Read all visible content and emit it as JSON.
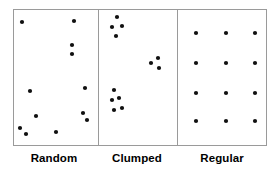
{
  "figure": {
    "frame": {
      "x": 13,
      "y": 9,
      "width": 253,
      "height": 136,
      "stroke": "#9a9a9a"
    },
    "dividers": [
      98,
      177
    ],
    "dot_color": "#101010",
    "dot_radius": 2.1,
    "panels": [
      {
        "id": "random",
        "label": "Random",
        "label_x": 54,
        "label_y": 162,
        "pattern": "random",
        "point_count": 12,
        "points": [
          [
            22,
            22
          ],
          [
            74,
            21
          ],
          [
            72,
            45
          ],
          [
            72,
            54
          ],
          [
            30,
            91
          ],
          [
            85,
            88
          ],
          [
            36,
            116
          ],
          [
            83,
            113
          ],
          [
            87,
            120
          ],
          [
            20,
            128
          ],
          [
            26,
            134
          ],
          [
            56,
            132
          ]
        ]
      },
      {
        "id": "clumped",
        "label": "Clumped",
        "label_x": 137,
        "label_y": 162,
        "pattern": "clumped",
        "point_count": 12,
        "points": [
          [
            117,
            17
          ],
          [
            112,
            27
          ],
          [
            122,
            26
          ],
          [
            116,
            36
          ],
          [
            158,
            58
          ],
          [
            151,
            63
          ],
          [
            159,
            68
          ],
          [
            114,
            90
          ],
          [
            119,
            98
          ],
          [
            112,
            100
          ],
          [
            122,
            108
          ],
          [
            114,
            110
          ]
        ]
      },
      {
        "id": "regular",
        "label": "Regular",
        "label_x": 222,
        "label_y": 162,
        "pattern": "regular",
        "point_count": 12,
        "points": [
          [
            196,
            33
          ],
          [
            226,
            33
          ],
          [
            255,
            33
          ],
          [
            196,
            63
          ],
          [
            226,
            63
          ],
          [
            255,
            63
          ],
          [
            196,
            93
          ],
          [
            226,
            93
          ],
          [
            255,
            93
          ],
          [
            196,
            121
          ],
          [
            226,
            121
          ],
          [
            255,
            121
          ]
        ]
      }
    ]
  },
  "chart_data": {
    "type": "scatter",
    "xlabel": "",
    "ylabel": "",
    "grid": false,
    "legend": "none",
    "series": [
      {
        "name": "Random",
        "x": [
          22,
          74,
          72,
          72,
          30,
          85,
          36,
          83,
          87,
          20,
          26,
          56
        ],
        "y": [
          22,
          21,
          45,
          54,
          91,
          88,
          116,
          113,
          120,
          128,
          134,
          132
        ]
      },
      {
        "name": "Clumped",
        "x": [
          117,
          112,
          122,
          116,
          158,
          151,
          159,
          114,
          119,
          112,
          122,
          114
        ],
        "y": [
          17,
          27,
          26,
          36,
          58,
          63,
          68,
          90,
          98,
          100,
          108,
          110
        ]
      },
      {
        "name": "Regular",
        "x": [
          196,
          226,
          255,
          196,
          226,
          255,
          196,
          226,
          255,
          196,
          226,
          255
        ],
        "y": [
          33,
          33,
          33,
          63,
          63,
          63,
          93,
          93,
          93,
          121,
          121,
          121
        ]
      }
    ]
  }
}
